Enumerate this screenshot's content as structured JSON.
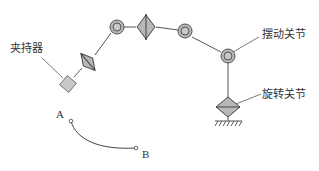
{
  "diagram": {
    "title": "",
    "labels": {
      "gripper": "夹持器",
      "swing_joint": "摆动关节",
      "rotary_joint": "旋转关节",
      "point_a": "A",
      "point_b": "B"
    },
    "colors": {
      "stroke": "#555555",
      "fill": "#bcbcbc",
      "fill_light": "#cfcfcf",
      "text": "#333333"
    },
    "components": [
      {
        "type": "gripper",
        "shape": "square-rotated"
      },
      {
        "type": "rotary-joint",
        "shape": "diamond-split"
      },
      {
        "type": "swing-joint",
        "shape": "double-circle"
      },
      {
        "type": "rotary-joint",
        "shape": "diamond-split"
      },
      {
        "type": "swing-joint",
        "shape": "double-circle"
      },
      {
        "type": "swing-joint",
        "shape": "double-circle"
      },
      {
        "type": "rotary-joint",
        "shape": "diamond-split"
      },
      {
        "type": "base",
        "shape": "ground-hatch"
      }
    ],
    "trajectory": {
      "from": "A",
      "to": "B",
      "shape": "arc"
    }
  }
}
